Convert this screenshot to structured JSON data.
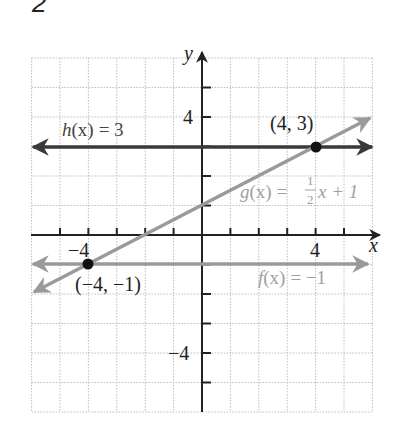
{
  "problem_number": "2",
  "chart_data": {
    "type": "line",
    "title": "",
    "xlabel": "x",
    "ylabel": "y",
    "xlim": [
      -6,
      6
    ],
    "ylim": [
      -6,
      6
    ],
    "grid": true,
    "x_tick_labels": [
      {
        "value": -4,
        "label": "−4"
      },
      {
        "value": 4,
        "label": "4"
      }
    ],
    "y_tick_labels": [
      {
        "value": 4,
        "label": "4"
      },
      {
        "value": -4,
        "label": "−4"
      }
    ],
    "series": [
      {
        "name": "h(x) = 3",
        "label": "h(x) = 3",
        "equation": "h(x)=3",
        "x": [
          -6,
          6
        ],
        "y": [
          3,
          3
        ],
        "color": "#3a3a3a"
      },
      {
        "name": "g(x) = 1/2 x + 1",
        "label": "g(x) = ½x + 1",
        "equation": "g(x)=x/2+1",
        "x": [
          -6,
          6
        ],
        "y": [
          -2,
          4
        ],
        "color": "#9a9a9a"
      },
      {
        "name": "f(x) = -1",
        "label": "f(x) = −1",
        "equation": "f(x)=-1",
        "x": [
          -6,
          6
        ],
        "y": [
          -1,
          -1
        ],
        "color": "#9a9a9a"
      }
    ],
    "points": [
      {
        "x": 4,
        "y": 3,
        "label": "(4, 3)"
      },
      {
        "x": -4,
        "y": -1,
        "label": "(−4, −1)"
      }
    ]
  },
  "labels": {
    "h": {
      "name": "h",
      "arg": "(x)",
      "eq": "= 3"
    },
    "g": {
      "name": "g",
      "arg": "(x)",
      "eq": "=",
      "num": "1",
      "den": "2",
      "rest": "x + 1"
    },
    "f": {
      "name": "f",
      "arg": "(x)",
      "eq": "= −1"
    },
    "p1": "(4, 3)",
    "p2": "(−4, −1)",
    "x_axis": "x",
    "y_axis": "y",
    "tick_x_neg4": "−4",
    "tick_x_4": "4",
    "tick_y_4": "4",
    "tick_y_neg4": "−4"
  }
}
